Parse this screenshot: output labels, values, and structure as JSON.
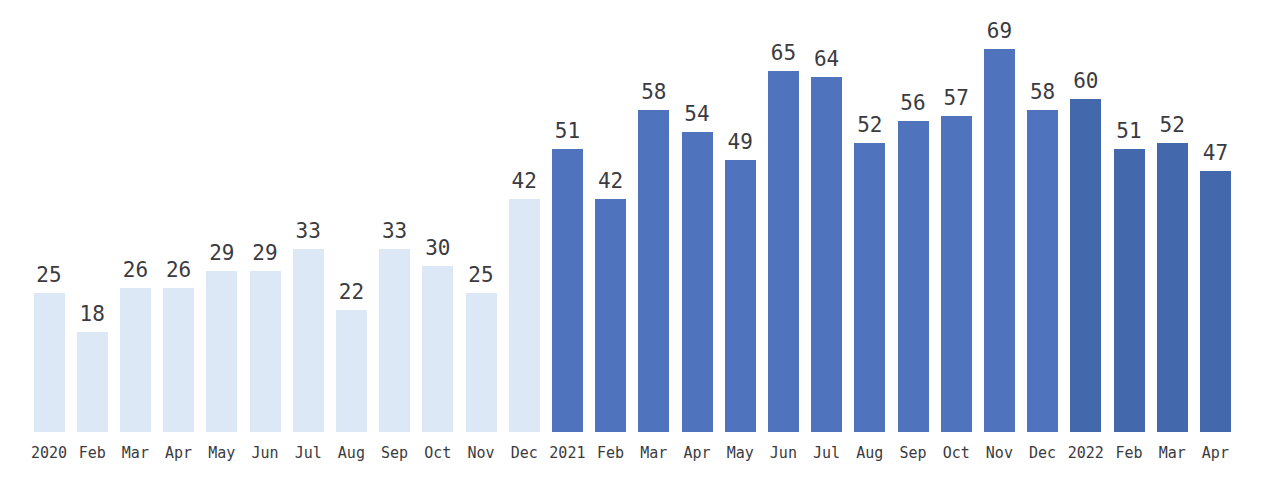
{
  "chart_data": {
    "type": "bar",
    "title": "",
    "subtitle": "",
    "xlabel": "",
    "ylabel": "",
    "ylim": [
      0,
      69
    ],
    "grid": false,
    "legend_position": "none",
    "categories": [
      "2020",
      "Feb",
      "Mar",
      "Apr",
      "May",
      "Jun",
      "Jul",
      "Aug",
      "Sep",
      "Oct",
      "Nov",
      "Dec",
      "2021",
      "Feb",
      "Mar",
      "Apr",
      "May",
      "Jun",
      "Jul",
      "Aug",
      "Sep",
      "Oct",
      "Nov",
      "Dec",
      "2022",
      "Feb",
      "Mar",
      "Apr"
    ],
    "values": [
      25,
      18,
      26,
      26,
      29,
      29,
      33,
      22,
      33,
      30,
      25,
      42,
      51,
      42,
      58,
      54,
      49,
      65,
      64,
      52,
      56,
      57,
      69,
      58,
      60,
      51,
      52,
      47
    ],
    "bar_tones": [
      "light",
      "light",
      "light",
      "light",
      "light",
      "light",
      "light",
      "light",
      "light",
      "light",
      "light",
      "light",
      "mid",
      "mid",
      "mid",
      "mid",
      "mid",
      "mid",
      "mid",
      "mid",
      "mid",
      "mid",
      "mid",
      "mid",
      "dark",
      "dark",
      "dark",
      "dark"
    ],
    "colors": {
      "bar_light": "#dce8f5",
      "bar_mid": "#5073bd",
      "bar_dark": "#4468ac",
      "label_text": "#3b3b3f",
      "background": "#ffffff"
    },
    "annotations": []
  }
}
